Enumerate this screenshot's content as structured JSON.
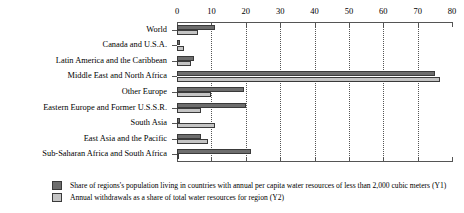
{
  "chart_data": {
    "type": "bar",
    "orientation": "horizontal",
    "title": "",
    "xlabel": "",
    "ylabel": "",
    "xlim": [
      0,
      80
    ],
    "xticks": [
      0,
      10,
      20,
      30,
      40,
      50,
      60,
      70,
      80
    ],
    "grid": true,
    "legend_position": "bottom-left",
    "categories": [
      "World",
      "Canada and U.S.A.",
      "Latin America and the Caribbean",
      "Middle East and North Africa",
      "Other Europe",
      "Eastern Europe and Former U.S.S.R.",
      "South Asia",
      "East Asia and the Pacific",
      "Sub-Saharan Africa and South Africa"
    ],
    "series": [
      {
        "name": "Share of regions's population living in countries with annual per capita water resources of less than 2,000 cubic meters (Y1)",
        "axis": "Y1",
        "color": "#6d6d6d",
        "values": [
          11,
          1,
          5,
          75,
          19.5,
          20,
          1,
          7,
          21.5
        ]
      },
      {
        "name": "Annual withdrawals as a share of total water resources for region (Y2)",
        "axis": "Y2",
        "color": "#c4c4c4",
        "values": [
          6,
          2,
          4,
          76.5,
          10,
          7,
          11,
          9,
          0.5
        ]
      }
    ]
  },
  "axis": {
    "tick_labels": [
      "0",
      "10",
      "20",
      "30",
      "40",
      "50",
      "60",
      "70",
      "80"
    ]
  },
  "legend": {
    "items": [
      {
        "label": "Share of regions's population living in countries with annual per capita water resources of less than 2,000 cubic meters (Y1)",
        "swatch": "y1"
      },
      {
        "label": "Annual withdrawals as a share of total water resources for region (Y2)",
        "swatch": "y2"
      }
    ]
  },
  "colors": {
    "series_y1": "#6d6d6d",
    "series_y2": "#c4c4c4",
    "axis": "#555555",
    "background": "#ffffff"
  }
}
